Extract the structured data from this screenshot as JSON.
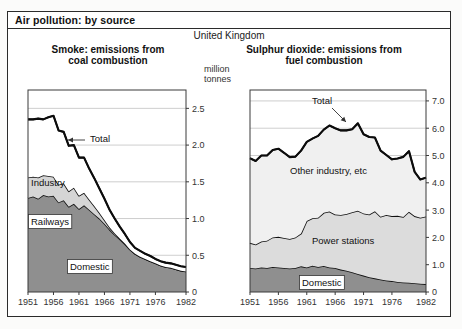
{
  "figure": {
    "title": "Air pollution: by source",
    "region": "United Kingdom"
  },
  "charts": [
    {
      "id": "smoke",
      "title_line1": "Smoke: emissions from",
      "title_line2": "coal combustion",
      "unit_line1": "million",
      "unit_line2": "tonnes",
      "total_label": "Total",
      "yticks": [
        "0",
        "0.5",
        "1.0",
        "1.5",
        "2.0",
        "2.5"
      ],
      "xticks": [
        "1951",
        "1956",
        "1961",
        "1966",
        "1971",
        "1976",
        "1982"
      ]
    },
    {
      "id": "sulphur",
      "title_line1": "Sulphur dioxide: emissions from",
      "title_line2": "fuel combustion",
      "unit_line1": "million",
      "unit_line2": "tonnes",
      "total_label": "Total",
      "yticks": [
        "0",
        "1.0",
        "2.0",
        "3.0",
        "4.0",
        "5.0",
        "6.0",
        "7.0"
      ],
      "xticks": [
        "1951",
        "1956",
        "1961",
        "1966",
        "1971",
        "1976",
        "1982"
      ]
    }
  ],
  "chart_data": [
    {
      "type": "area",
      "id": "smoke",
      "title": "Smoke: emissions from coal combustion",
      "subtitle": "United Kingdom",
      "xlabel": "",
      "ylabel": "million tonnes",
      "ylim": [
        0,
        2.75
      ],
      "xlim": [
        1951,
        1982
      ],
      "grid": true,
      "legend": "in-plot labels",
      "yticks": [
        0,
        0.5,
        1.0,
        1.5,
        2.0,
        2.5
      ],
      "xticks": [
        1951,
        1956,
        1961,
        1966,
        1971,
        1976,
        1982
      ],
      "x": [
        1951,
        1952,
        1953,
        1954,
        1955,
        1956,
        1957,
        1958,
        1959,
        1960,
        1961,
        1962,
        1963,
        1964,
        1965,
        1966,
        1967,
        1968,
        1969,
        1970,
        1971,
        1972,
        1973,
        1974,
        1975,
        1976,
        1977,
        1978,
        1979,
        1980,
        1981,
        1982
      ],
      "stacked": true,
      "series": [
        {
          "name": "Domestic",
          "fill": "#8f8f8f",
          "values": [
            1.28,
            1.3,
            1.27,
            1.32,
            1.3,
            1.31,
            1.22,
            1.25,
            1.16,
            1.2,
            1.13,
            1.18,
            1.12,
            1.06,
            1.0,
            0.93,
            0.85,
            0.78,
            0.72,
            0.65,
            0.58,
            0.52,
            0.48,
            0.45,
            0.42,
            0.39,
            0.36,
            0.34,
            0.33,
            0.31,
            0.29,
            0.28
          ]
        },
        {
          "name": "Railways",
          "fill": "#d5d5d5",
          "values": [
            0.28,
            0.27,
            0.29,
            0.27,
            0.28,
            0.26,
            0.24,
            0.23,
            0.21,
            0.22,
            0.18,
            0.17,
            0.14,
            0.11,
            0.08,
            0.05,
            0.03,
            0.02,
            0.01,
            0.01,
            0.0,
            0.0,
            0.0,
            0.0,
            0.0,
            0.0,
            0.0,
            0.0,
            0.0,
            0.0,
            0.0,
            0.0
          ]
        },
        {
          "name": "Industry",
          "fill": "#ffffff",
          "values": [
            0.79,
            0.78,
            0.8,
            0.76,
            0.8,
            0.83,
            0.74,
            0.7,
            0.62,
            0.58,
            0.52,
            0.48,
            0.42,
            0.38,
            0.33,
            0.29,
            0.24,
            0.2,
            0.16,
            0.13,
            0.1,
            0.08,
            0.08,
            0.07,
            0.07,
            0.06,
            0.06,
            0.06,
            0.06,
            0.06,
            0.06,
            0.06
          ]
        }
      ],
      "total": {
        "name": "Total",
        "values": [
          2.35,
          2.35,
          2.36,
          2.35,
          2.38,
          2.4,
          2.2,
          2.18,
          1.99,
          2.0,
          1.83,
          1.83,
          1.68,
          1.55,
          1.41,
          1.27,
          1.12,
          1.0,
          0.89,
          0.79,
          0.68,
          0.6,
          0.56,
          0.52,
          0.49,
          0.45,
          0.42,
          0.4,
          0.39,
          0.37,
          0.35,
          0.34
        ]
      },
      "annotations": [
        "Total",
        "Industry",
        "Railways",
        "Domestic"
      ]
    },
    {
      "type": "area",
      "id": "sulphur",
      "title": "Sulphur dioxide: emissions from fuel combustion",
      "subtitle": "United Kingdom",
      "xlabel": "",
      "ylabel": "million tonnes",
      "ylim": [
        0,
        7.4
      ],
      "xlim": [
        1951,
        1982
      ],
      "grid": true,
      "legend": "in-plot labels",
      "yticks": [
        0,
        1.0,
        2.0,
        3.0,
        4.0,
        5.0,
        6.0,
        7.0
      ],
      "xticks": [
        1951,
        1956,
        1961,
        1966,
        1971,
        1976,
        1982
      ],
      "x": [
        1951,
        1952,
        1953,
        1954,
        1955,
        1956,
        1957,
        1958,
        1959,
        1960,
        1961,
        1962,
        1963,
        1964,
        1965,
        1966,
        1967,
        1968,
        1969,
        1970,
        1971,
        1972,
        1973,
        1974,
        1975,
        1976,
        1977,
        1978,
        1979,
        1980,
        1981,
        1982
      ],
      "stacked": true,
      "series": [
        {
          "name": "Domestic",
          "fill": "#8f8f8f",
          "values": [
            0.88,
            0.86,
            0.9,
            0.88,
            0.92,
            0.9,
            0.88,
            0.86,
            0.88,
            0.94,
            0.9,
            0.96,
            0.92,
            0.95,
            0.9,
            0.88,
            0.82,
            0.78,
            0.72,
            0.66,
            0.6,
            0.54,
            0.5,
            0.46,
            0.42,
            0.4,
            0.37,
            0.35,
            0.34,
            0.32,
            0.3,
            0.29
          ]
        },
        {
          "name": "Power stations",
          "fill": "#dcdcdc",
          "values": [
            0.92,
            0.88,
            0.95,
            1.0,
            1.08,
            1.12,
            1.1,
            1.08,
            1.12,
            1.2,
            1.7,
            1.74,
            1.8,
            1.95,
            2.05,
            1.96,
            2.0,
            2.08,
            2.2,
            2.32,
            2.28,
            2.3,
            2.46,
            2.3,
            2.4,
            2.38,
            2.42,
            2.4,
            2.6,
            2.46,
            2.42,
            2.48
          ]
        },
        {
          "name": "Other industry, etc",
          "fill": "#f0f0f0",
          "values": [
            3.1,
            3.06,
            3.15,
            3.12,
            3.2,
            3.23,
            3.12,
            3.0,
            2.96,
            3.04,
            2.9,
            2.92,
            3.0,
            3.05,
            3.15,
            3.16,
            3.1,
            3.06,
            3.04,
            3.2,
            2.9,
            2.84,
            2.7,
            2.42,
            2.2,
            2.08,
            2.1,
            2.2,
            2.22,
            1.62,
            1.4,
            1.42
          ]
        }
      ],
      "total": {
        "name": "Total",
        "values": [
          4.9,
          4.8,
          5.0,
          5.0,
          5.2,
          5.25,
          5.1,
          4.94,
          4.96,
          5.18,
          5.5,
          5.62,
          5.72,
          5.95,
          6.1,
          6.0,
          5.92,
          5.92,
          5.96,
          6.18,
          5.78,
          5.68,
          5.66,
          5.18,
          5.02,
          4.86,
          4.89,
          4.95,
          5.16,
          4.4,
          4.12,
          4.19
        ]
      },
      "annotations": [
        "Total",
        "Other industry, etc",
        "Power stations",
        "Domestic"
      ]
    }
  ]
}
